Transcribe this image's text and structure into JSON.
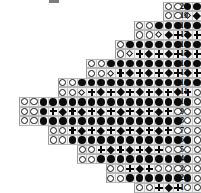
{
  "chart_data": {
    "type": "heatmap",
    "xlabel": "",
    "ylabel": "Row number",
    "grid": true,
    "legend_position": "none",
    "rows_count": 20,
    "columns_max": 19,
    "cell_size_px": 9.6,
    "row_numbers": [
      "20",
      "19",
      "18",
      "17",
      "16",
      "15",
      "14",
      "13",
      "12",
      "11",
      "10",
      "9",
      "8",
      "7",
      "6",
      "5",
      "4",
      "3",
      "2",
      "1"
    ],
    "symbol_key": {
      "open": "open-circle",
      "fill": "filled-circle",
      "plus": "plus-cross",
      "diamond": "filled-diamond",
      "odiamond": "open-diamond",
      "empty": "no-cell"
    },
    "rows": [
      {
        "number": "20",
        "offset": 17,
        "cells": [
          "open",
          "open",
          "fill",
          "fill",
          "fill",
          "fill",
          "fill",
          "fill",
          "fill",
          "fill",
          "fill",
          "fill",
          "open",
          "open"
        ]
      },
      {
        "number": "19",
        "offset": 17,
        "cells": [
          "open",
          "open",
          "odiamond",
          "diamond",
          "plus",
          "open",
          "open",
          "open",
          "open",
          "open",
          "open",
          "open",
          "open",
          "open"
        ]
      },
      {
        "number": "18",
        "offset": 14,
        "cells": [
          "open",
          "open",
          "fill",
          "fill",
          "fill",
          "fill",
          "fill",
          "fill",
          "fill",
          "fill",
          "fill",
          "fill",
          "fill",
          "fill",
          "open",
          "open"
        ]
      },
      {
        "number": "17",
        "offset": 14,
        "cells": [
          "open",
          "open",
          "odiamond",
          "diamond",
          "plus",
          "diamond",
          "plus",
          "open",
          "open",
          "open",
          "open",
          "open",
          "open",
          "open",
          "open",
          "open"
        ]
      },
      {
        "number": "16",
        "offset": 12,
        "cells": [
          "open",
          "fill",
          "fill",
          "fill",
          "fill",
          "fill",
          "fill",
          "fill",
          "fill",
          "fill",
          "fill",
          "fill",
          "fill",
          "fill",
          "fill",
          "fill",
          "open"
        ]
      },
      {
        "number": "15",
        "offset": 12,
        "cells": [
          "open",
          "odiamond",
          "plus",
          "diamond",
          "plus",
          "diamond",
          "plus",
          "diamond",
          "plus",
          "open",
          "open",
          "open",
          "open",
          "open",
          "open",
          "open",
          "open"
        ]
      },
      {
        "number": "14",
        "offset": 9,
        "cells": [
          "open",
          "open",
          "fill",
          "fill",
          "fill",
          "fill",
          "fill",
          "fill",
          "fill",
          "fill",
          "fill",
          "fill",
          "fill",
          "fill",
          "fill",
          "fill",
          "fill",
          "open",
          "open"
        ]
      },
      {
        "number": "13",
        "offset": 9,
        "cells": [
          "open",
          "open",
          "odiamond",
          "plus",
          "diamond",
          "plus",
          "diamond",
          "plus",
          "diamond",
          "plus",
          "diamond",
          "plus",
          "open",
          "open",
          "open",
          "open",
          "open",
          "open"
        ]
      },
      {
        "number": "12",
        "offset": 6,
        "cells": [
          "open",
          "open",
          "fill",
          "fill",
          "fill",
          "fill",
          "fill",
          "fill",
          "fill",
          "fill",
          "fill",
          "fill",
          "fill",
          "fill",
          "fill",
          "fill",
          "fill",
          "fill",
          "open"
        ]
      },
      {
        "number": "11",
        "offset": 6,
        "cells": [
          "open",
          "open",
          "odiamond",
          "plus",
          "diamond",
          "plus",
          "diamond",
          "plus",
          "diamond",
          "plus",
          "diamond",
          "plus",
          "diamond",
          "plus",
          "open",
          "open",
          "open",
          "open"
        ]
      },
      {
        "number": "10",
        "offset": 2,
        "cells": [
          "open",
          "open",
          "fill",
          "fill",
          "fill",
          "fill",
          "fill",
          "fill",
          "fill",
          "fill",
          "fill",
          "fill",
          "fill",
          "fill",
          "fill",
          "fill",
          "fill",
          "fill",
          "open",
          "open"
        ]
      },
      {
        "number": "9",
        "offset": 2,
        "cells": [
          "open",
          "open",
          "fill",
          "plus",
          "diamond",
          "plus",
          "diamond",
          "plus",
          "diamond",
          "plus",
          "diamond",
          "plus",
          "diamond",
          "plus",
          "diamond",
          "plus",
          "open",
          "open",
          "open"
        ]
      },
      {
        "number": "8",
        "offset": 2,
        "cells": [
          "open",
          "open",
          "fill",
          "fill",
          "fill",
          "fill",
          "fill",
          "fill",
          "fill",
          "fill",
          "fill",
          "fill",
          "fill",
          "fill",
          "fill",
          "fill",
          "fill",
          "open",
          "open"
        ]
      },
      {
        "number": "7",
        "offset": 5,
        "cells": [
          "open",
          "open",
          "plus",
          "diamond",
          "plus",
          "diamond",
          "plus",
          "diamond",
          "plus",
          "diamond",
          "plus",
          "diamond",
          "plus",
          "open",
          "open",
          "open"
        ]
      },
      {
        "number": "6",
        "offset": 5,
        "cells": [
          "open",
          "open",
          "fill",
          "fill",
          "fill",
          "fill",
          "fill",
          "fill",
          "fill",
          "fill",
          "fill",
          "fill",
          "fill",
          "fill",
          "fill",
          "open"
        ]
      },
      {
        "number": "5",
        "offset": 8,
        "cells": [
          "open",
          "open",
          "plus",
          "diamond",
          "plus",
          "diamond",
          "plus",
          "diamond",
          "plus",
          "open",
          "open",
          "open",
          "open",
          "open"
        ]
      },
      {
        "number": "4",
        "offset": 8,
        "cells": [
          "open",
          "open",
          "fill",
          "fill",
          "fill",
          "fill",
          "fill",
          "fill",
          "fill",
          "fill",
          "fill",
          "fill",
          "open",
          "open"
        ]
      },
      {
        "number": "3",
        "offset": 11,
        "cells": [
          "open",
          "open",
          "plus",
          "diamond",
          "plus",
          "open",
          "open",
          "open",
          "open",
          "open",
          "open",
          "open"
        ]
      },
      {
        "number": "2",
        "offset": 11,
        "cells": [
          "open",
          "open",
          "fill",
          "fill",
          "fill",
          "fill",
          "fill",
          "fill",
          "fill",
          "open",
          "open",
          "open"
        ]
      },
      {
        "number": "1",
        "offset": 14,
        "cells": [
          "open",
          "open",
          "plus",
          "diamond",
          "plus",
          "open",
          "open",
          "open",
          "open",
          "open"
        ]
      }
    ]
  }
}
